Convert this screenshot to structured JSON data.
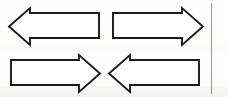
{
  "figure": {
    "background_color": "#fdfdfc",
    "stroke_color": "#1b1b1b",
    "fill_color": "#ffffff",
    "width": 228,
    "height": 97
  },
  "shapes": [
    {
      "name": "arrow-top-left",
      "label": "Left-pointing block arrow",
      "direction": "left",
      "row": 1,
      "column": 1,
      "bbox": {
        "x": 8,
        "y": 8,
        "width": 92,
        "height": 37
      },
      "points": "99,13 30,13 30,8 9,26.5 30,45 30,38 99,38"
    },
    {
      "name": "arrow-top-right",
      "label": "Right-pointing block arrow",
      "direction": "right",
      "row": 1,
      "column": 2,
      "bbox": {
        "x": 112,
        "y": 8,
        "width": 92,
        "height": 37
      },
      "points": "113,13 182,13 182,8 203,26.5 182,45 182,38 113,38"
    },
    {
      "name": "arrow-bottom-left",
      "label": "Right-pointing block arrow",
      "direction": "right",
      "row": 2,
      "column": 1,
      "bbox": {
        "x": 10,
        "y": 55,
        "width": 91,
        "height": 37
      },
      "points": "11,60 79,60 79,55 100,73.5 79,92 79,85 11,85"
    },
    {
      "name": "arrow-bottom-right",
      "label": "Left-pointing block arrow",
      "direction": "left",
      "row": 2,
      "column": 2,
      "bbox": {
        "x": 108,
        "y": 55,
        "width": 92,
        "height": 37
      },
      "points": "199,60 130,60 130,55 109,73.5 130,92 130,85 199,85"
    }
  ],
  "divider": {
    "name": "vertical-rule",
    "label": "Vertical rule at right margin",
    "color": "#9a9a9a",
    "x": 211.5,
    "y_start": 3,
    "y_end": 94
  }
}
